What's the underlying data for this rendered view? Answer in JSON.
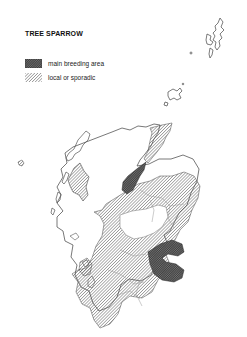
{
  "map": {
    "title": "TREE SPARROW",
    "legend": [
      {
        "key": "main",
        "label": "main breeding area",
        "pattern": "dense-crosshatch",
        "color": "#333333"
      },
      {
        "key": "local",
        "label": "local or sporadic",
        "pattern": "diagonal-hatch",
        "color": "#555555"
      }
    ],
    "colors": {
      "outline": "#555555",
      "boundaries": "#999999",
      "background": "#ffffff"
    }
  }
}
